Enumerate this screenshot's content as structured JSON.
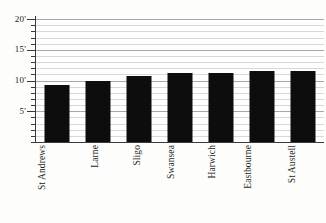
{
  "chart_data": {
    "type": "bar",
    "title": "",
    "subtitle": "",
    "xlabel": "",
    "ylabel": "",
    "categories": [
      "St Andrews",
      "Larne",
      "Sligo",
      "Swansea",
      "Harwich",
      "Eastbourne",
      "St Austell"
    ],
    "values": [
      9.2,
      10.0,
      10.8,
      11.3,
      11.3,
      11.6,
      11.6
    ],
    "ylim": [
      0,
      20.5
    ],
    "y_major_ticks": [
      5,
      10,
      15,
      20
    ],
    "y_tick_labels": [
      "5'",
      "10'",
      "15'",
      "20'"
    ],
    "y_minor_tick_step": 1,
    "grid": "horizontal",
    "legend": "none",
    "bar_color": "#0d0d0d",
    "background_color": "#fdfdfb",
    "gridline_color": "#d8d8d4",
    "gridline_major_color": "#a8a8a4",
    "axis_color": "#3a3a3a",
    "x_label_rotation": -90,
    "unit_symbol": "'"
  },
  "axis": {
    "y_labels": [
      {
        "text": "20'",
        "value": 20
      },
      {
        "text": "15'",
        "value": 15
      },
      {
        "text": "10'",
        "value": 10
      },
      {
        "text": "5'",
        "value": 5
      }
    ]
  },
  "bars": [
    {
      "label": "St Andrews",
      "value": 9.2
    },
    {
      "label": "Larne",
      "value": 10.0
    },
    {
      "label": "Sligo",
      "value": 10.8
    },
    {
      "label": "Swansea",
      "value": 11.3
    },
    {
      "label": "Harwich",
      "value": 11.3
    },
    {
      "label": "Eastbourne",
      "value": 11.6
    },
    {
      "label": "St Austell",
      "value": 11.6
    }
  ]
}
